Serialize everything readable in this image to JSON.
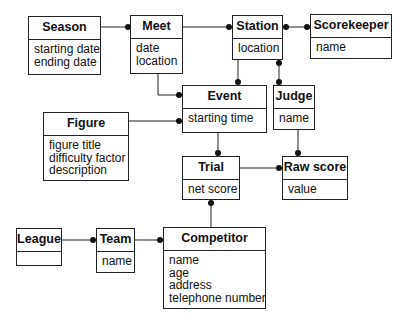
{
  "diagram": {
    "type": "entity-relationship",
    "entities": [
      {
        "id": "season",
        "name": "Season",
        "attributes": [
          "starting date",
          "ending date"
        ]
      },
      {
        "id": "meet",
        "name": "Meet",
        "attributes": [
          "date",
          "location"
        ]
      },
      {
        "id": "station",
        "name": "Station",
        "attributes": [
          "location"
        ]
      },
      {
        "id": "scorekeeper",
        "name": "Scorekeeper",
        "attributes": [
          "name"
        ]
      },
      {
        "id": "event",
        "name": "Event",
        "attributes": [
          "starting time"
        ]
      },
      {
        "id": "judge",
        "name": "Judge",
        "attributes": [
          "name"
        ]
      },
      {
        "id": "figure",
        "name": "Figure",
        "attributes": [
          "figure title",
          "difficulty factor",
          "description"
        ]
      },
      {
        "id": "trial",
        "name": "Trial",
        "attributes": [
          "net score"
        ]
      },
      {
        "id": "rawscore",
        "name": "Raw score",
        "attributes": [
          "value"
        ]
      },
      {
        "id": "league",
        "name": "League",
        "attributes": []
      },
      {
        "id": "team",
        "name": "Team",
        "attributes": [
          "name"
        ]
      },
      {
        "id": "competitor",
        "name": "Competitor",
        "attributes": [
          "name",
          "age",
          "address",
          "telephone number"
        ]
      }
    ],
    "relationships": [
      {
        "from": "Season",
        "to": "Meet",
        "many_end": "Meet"
      },
      {
        "from": "Meet",
        "to": "Station",
        "many_end": "Station"
      },
      {
        "from": "Station",
        "to": "Scorekeeper",
        "many_end": "both"
      },
      {
        "from": "Meet",
        "to": "Event",
        "many_end": "Event"
      },
      {
        "from": "Station",
        "to": "Event",
        "many_end": "Event"
      },
      {
        "from": "Station",
        "to": "Judge",
        "many_end": "both"
      },
      {
        "from": "Figure",
        "to": "Event",
        "many_end": "Event"
      },
      {
        "from": "Event",
        "to": "Trial",
        "many_end": "Trial"
      },
      {
        "from": "Judge",
        "to": "Raw score",
        "many_end": "Raw score"
      },
      {
        "from": "Trial",
        "to": "Raw score",
        "many_end": "Raw score"
      },
      {
        "from": "Competitor",
        "to": "Trial",
        "many_end": "Trial"
      },
      {
        "from": "League",
        "to": "Team",
        "many_end": "Team"
      },
      {
        "from": "Team",
        "to": "Competitor",
        "many_end": "Competitor"
      }
    ],
    "colors": {
      "line": "#222222",
      "background": "#ffffff"
    }
  }
}
